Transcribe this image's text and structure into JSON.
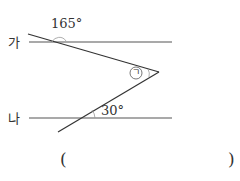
{
  "diagram": {
    "line_labels": {
      "top": "가",
      "bottom": "나"
    },
    "angles": {
      "top_exterior": "165°",
      "bottom": "30°",
      "unknown_symbol": "ㄱ"
    },
    "answer": {
      "open": "(",
      "close": ")"
    }
  }
}
